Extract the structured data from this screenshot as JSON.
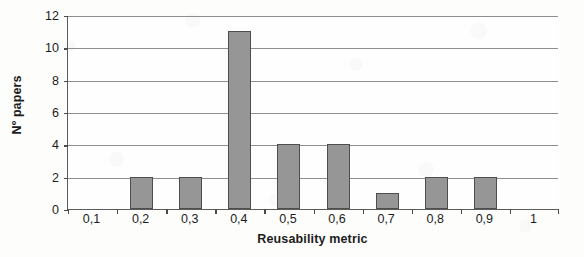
{
  "chart_data": {
    "type": "bar",
    "title": "",
    "xlabel": "Reusability metric",
    "ylabel": "Nº papers",
    "categories": [
      "0,1",
      "0,2",
      "0,3",
      "0,4",
      "0,5",
      "0,6",
      "0,7",
      "0,8",
      "0,9",
      "1"
    ],
    "values": [
      0,
      2,
      2,
      11,
      4,
      4,
      1,
      2,
      2,
      0
    ],
    "ylim": [
      0,
      12
    ],
    "ytick_labels": [
      "0",
      "2",
      "4",
      "6",
      "8",
      "10",
      "12"
    ],
    "ytick_values": [
      0,
      2,
      4,
      6,
      8,
      10,
      12
    ],
    "grid": "horizontal",
    "legend": "none",
    "colors": {
      "bar_fill": "#969696",
      "bar_edge": "#4e4e4e",
      "gridline": "#8e8e8e",
      "axis": "#5c5c5c",
      "text": "#1c1c1c",
      "background": "#fdfdfc"
    }
  }
}
